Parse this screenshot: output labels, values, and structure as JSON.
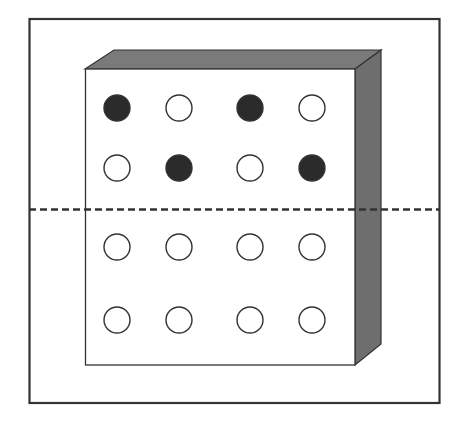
{
  "diagram": {
    "colors": {
      "frame": "#333333",
      "box_face": "#ffffff",
      "box_side": "#777777",
      "filled_circle": "#2b2b2b",
      "empty_circle": "#ffffff",
      "dashed_line": "#333333"
    },
    "grid": {
      "rows": 4,
      "cols": 4,
      "col_x": [
        117,
        179,
        250,
        312
      ],
      "row_y": [
        108,
        168,
        247,
        320
      ],
      "radius": 13,
      "cells": [
        [
          "filled",
          "empty",
          "filled",
          "empty"
        ],
        [
          "empty",
          "filled",
          "empty",
          "filled"
        ],
        [
          "empty",
          "empty",
          "empty",
          "empty"
        ],
        [
          "empty",
          "empty",
          "empty",
          "empty"
        ]
      ]
    }
  }
}
